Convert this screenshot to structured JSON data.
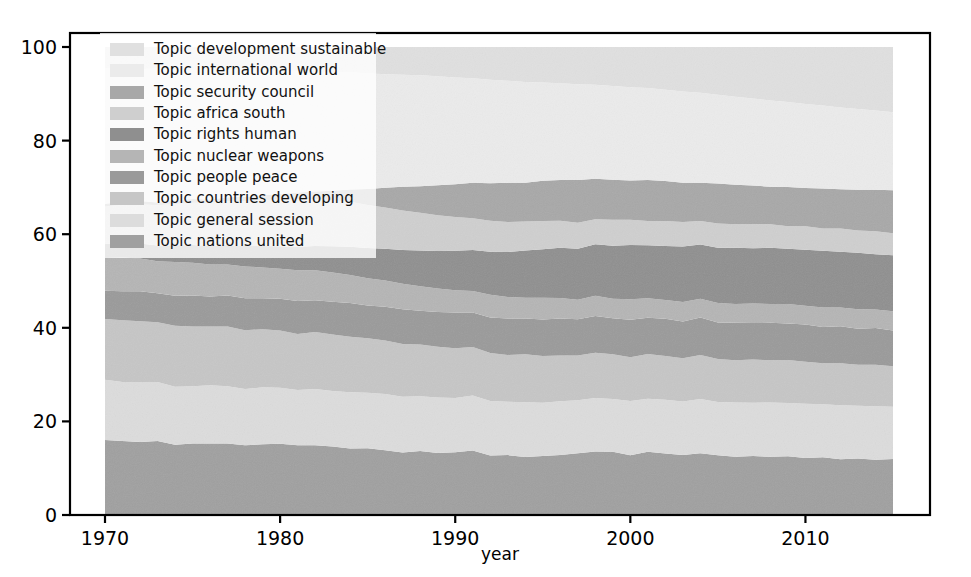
{
  "chart_data": {
    "type": "area",
    "stacked": true,
    "title": "",
    "subtitle": "",
    "xlabel": "year",
    "ylabel": "",
    "xlim": [
      1970,
      2015
    ],
    "ylim": [
      0,
      100
    ],
    "xticks": [
      1970,
      1980,
      1990,
      2000,
      2010
    ],
    "yticks": [
      0,
      20,
      40,
      60,
      80,
      100
    ],
    "xtick_labels": [
      "1970",
      "1980",
      "1990",
      "2000",
      "2010"
    ],
    "ytick_labels": [
      "0",
      "20",
      "40",
      "60",
      "80",
      "100"
    ],
    "grid": false,
    "legend_position": "upper-left",
    "x": [
      1970,
      1971,
      1972,
      1973,
      1974,
      1975,
      1976,
      1977,
      1978,
      1979,
      1980,
      1981,
      1982,
      1983,
      1984,
      1985,
      1986,
      1987,
      1988,
      1989,
      1990,
      1991,
      1992,
      1993,
      1994,
      1995,
      1996,
      1997,
      1998,
      1999,
      2000,
      2001,
      2002,
      2003,
      2004,
      2005,
      2006,
      2007,
      2008,
      2009,
      2010,
      2011,
      2012,
      2013,
      2014,
      2015
    ],
    "series": [
      {
        "name": "Topic development sustainable",
        "color": "#e0e0e0",
        "values": [
          4.5,
          4.6,
          4.7,
          4.6,
          4.8,
          4.9,
          4.8,
          4.9,
          5.0,
          5.1,
          5.2,
          5.1,
          5.3,
          5.4,
          5.4,
          5.6,
          5.8,
          5.9,
          6.0,
          6.2,
          6.5,
          6.7,
          7.0,
          7.2,
          7.4,
          7.6,
          7.8,
          8.0,
          8.2,
          8.4,
          8.6,
          8.8,
          9.2,
          9.5,
          9.8,
          10.2,
          10.6,
          11.0,
          11.4,
          11.8,
          12.2,
          12.6,
          13.0,
          13.4,
          13.8,
          14.2
        ]
      },
      {
        "name": "Topic international world",
        "color": "#ebebeb",
        "values": [
          29.0,
          28.5,
          28.2,
          28.6,
          28.0,
          27.6,
          27.8,
          27.2,
          27.0,
          26.6,
          26.2,
          26.0,
          25.6,
          25.2,
          25.0,
          24.6,
          24.2,
          23.8,
          23.6,
          23.2,
          22.8,
          22.4,
          22.0,
          21.8,
          21.4,
          21.0,
          20.8,
          20.6,
          20.4,
          20.2,
          20.0,
          19.8,
          19.6,
          19.4,
          19.2,
          19.0,
          18.8,
          18.6,
          18.4,
          18.2,
          18.0,
          17.8,
          17.6,
          17.4,
          17.2,
          17.0
        ]
      },
      {
        "name": "Topic security council",
        "color": "#a8a8a8",
        "values": [
          0.6,
          0.6,
          0.7,
          0.6,
          0.7,
          0.8,
          0.7,
          0.8,
          0.9,
          1.0,
          1.2,
          1.4,
          1.6,
          2.0,
          2.6,
          3.4,
          4.2,
          5.0,
          5.6,
          6.4,
          7.0,
          7.6,
          8.0,
          8.4,
          8.2,
          8.6,
          8.8,
          9.2,
          8.8,
          8.6,
          8.4,
          8.8,
          8.6,
          8.4,
          8.2,
          8.6,
          8.4,
          8.2,
          8.0,
          8.4,
          8.2,
          8.6,
          8.4,
          8.8,
          9.0,
          9.4
        ]
      },
      {
        "name": "Topic africa south",
        "color": "#cfcfcf",
        "values": [
          8.0,
          8.2,
          8.4,
          8.6,
          8.8,
          9.0,
          9.2,
          9.4,
          9.6,
          9.8,
          10.0,
          10.2,
          10.0,
          9.8,
          9.6,
          9.2,
          8.8,
          8.4,
          8.0,
          7.6,
          7.2,
          6.8,
          6.6,
          6.4,
          6.2,
          6.0,
          5.8,
          5.6,
          5.4,
          5.6,
          5.4,
          5.2,
          5.4,
          5.2,
          5.0,
          5.2,
          5.0,
          5.2,
          5.0,
          4.8,
          5.0,
          4.8,
          5.0,
          4.8,
          5.0,
          4.8
        ]
      },
      {
        "name": "Topic rights human",
        "color": "#8f8f8f",
        "values": [
          3.0,
          3.1,
          3.2,
          3.4,
          3.6,
          3.8,
          4.0,
          4.2,
          4.4,
          4.6,
          4.8,
          5.0,
          5.2,
          5.6,
          6.0,
          6.4,
          6.8,
          7.2,
          7.6,
          8.0,
          8.4,
          8.8,
          9.2,
          9.6,
          10.0,
          10.4,
          10.8,
          11.0,
          11.2,
          11.4,
          11.6,
          11.4,
          11.6,
          11.8,
          11.6,
          11.8,
          12.0,
          11.8,
          12.0,
          11.8,
          12.0,
          12.2,
          12.0,
          12.2,
          12.0,
          12.2
        ]
      },
      {
        "name": "Topic nuclear weapons",
        "color": "#b5b5b5",
        "values": [
          7.0,
          7.2,
          7.0,
          6.8,
          7.2,
          7.0,
          6.8,
          6.6,
          6.8,
          6.6,
          6.4,
          6.6,
          6.4,
          6.2,
          6.0,
          5.8,
          5.6,
          5.4,
          5.2,
          5.0,
          4.8,
          4.6,
          4.8,
          4.6,
          4.4,
          4.6,
          4.4,
          4.2,
          4.4,
          4.2,
          4.4,
          4.2,
          4.0,
          4.2,
          4.0,
          4.2,
          4.0,
          4.2,
          4.0,
          4.2,
          4.0,
          4.2,
          4.0,
          4.2,
          4.0,
          4.2
        ]
      },
      {
        "name": "Topic people peace",
        "color": "#9a9a9a",
        "values": [
          6.0,
          6.2,
          6.4,
          6.2,
          6.4,
          6.6,
          6.4,
          6.6,
          6.8,
          6.6,
          6.8,
          7.0,
          6.8,
          7.0,
          7.2,
          7.0,
          7.2,
          7.4,
          7.2,
          7.4,
          7.6,
          7.4,
          7.6,
          7.8,
          7.6,
          7.8,
          8.0,
          7.8,
          8.0,
          7.8,
          8.0,
          7.8,
          8.0,
          7.8,
          8.0,
          7.8,
          8.0,
          7.8,
          8.0,
          7.8,
          8.0,
          7.8,
          8.0,
          7.8,
          8.0,
          7.8
        ]
      },
      {
        "name": "Topic countries developing",
        "color": "#c6c6c6",
        "values": [
          13.0,
          13.2,
          13.0,
          12.8,
          13.0,
          12.8,
          12.6,
          12.8,
          12.6,
          12.4,
          12.2,
          12.0,
          12.2,
          12.0,
          11.8,
          11.6,
          11.4,
          11.2,
          11.0,
          10.8,
          10.6,
          10.4,
          10.2,
          10.0,
          10.2,
          10.0,
          9.8,
          9.6,
          9.8,
          9.6,
          9.4,
          9.6,
          9.4,
          9.2,
          9.4,
          9.2,
          9.0,
          9.2,
          9.0,
          9.2,
          9.0,
          8.8,
          9.0,
          8.8,
          9.0,
          8.8
        ]
      },
      {
        "name": "Topic general session",
        "color": "#dcdcdc",
        "values": [
          12.9,
          12.6,
          12.8,
          12.6,
          12.4,
          12.2,
          12.4,
          12.2,
          12.0,
          12.2,
          12.0,
          11.8,
          12.0,
          11.8,
          12.0,
          11.8,
          12.0,
          11.8,
          11.6,
          11.8,
          11.6,
          11.8,
          11.6,
          11.4,
          11.6,
          11.4,
          11.6,
          11.4,
          11.6,
          11.4,
          11.6,
          11.4,
          11.6,
          11.4,
          11.6,
          11.4,
          11.6,
          11.4,
          11.6,
          11.4,
          11.6,
          11.4,
          11.6,
          11.4,
          11.6,
          11.4
        ]
      },
      {
        "name": "Topic nations united",
        "color": "#a0a0a0",
        "values": [
          16.0,
          15.8,
          15.6,
          15.8,
          15.0,
          15.3,
          15.3,
          15.3,
          14.9,
          15.1,
          15.2,
          14.9,
          14.9,
          14.6,
          14.2,
          14.2,
          13.8,
          13.3,
          13.6,
          13.2,
          13.4,
          13.8,
          12.7,
          12.8,
          12.3,
          12.6,
          12.9,
          13.3,
          13.8,
          13.6,
          12.8,
          13.6,
          13.2,
          12.8,
          13.2,
          12.8,
          12.4,
          12.6,
          12.4,
          12.6,
          12.2,
          12.4,
          12.0,
          12.2,
          12.0,
          12.2
        ]
      }
    ]
  },
  "axis": {
    "x_label": "year"
  },
  "legend": {
    "items": [
      {
        "label": "Topic development sustainable",
        "color": "#e0e0e0"
      },
      {
        "label": "Topic international world",
        "color": "#ebebeb"
      },
      {
        "label": "Topic security council",
        "color": "#a8a8a8"
      },
      {
        "label": "Topic africa south",
        "color": "#cfcfcf"
      },
      {
        "label": "Topic rights human",
        "color": "#8f8f8f"
      },
      {
        "label": "Topic nuclear weapons",
        "color": "#b5b5b5"
      },
      {
        "label": "Topic people peace",
        "color": "#9a9a9a"
      },
      {
        "label": "Topic countries developing",
        "color": "#c6c6c6"
      },
      {
        "label": "Topic general session",
        "color": "#dcdcdc"
      },
      {
        "label": "Topic nations united",
        "color": "#a0a0a0"
      }
    ]
  }
}
